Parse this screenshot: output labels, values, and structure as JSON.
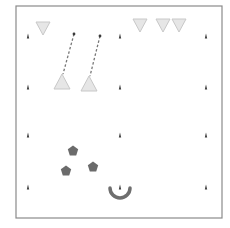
{
  "diagram": {
    "type": "drill-field",
    "colors": {
      "background": "#ffffff",
      "frame": "#8a8a8a",
      "marker": "#3a3a3a",
      "triangle_fill": "#e6e6e6",
      "triangle_stroke": "#c8c8c8",
      "path": "#777777",
      "pentagon": "#6b6b6b",
      "arc": "#6e6e6e"
    },
    "frame": {
      "x": 16,
      "y": 6,
      "w": 206,
      "h": 212
    },
    "markers": [
      {
        "x": 28,
        "y": 36
      },
      {
        "x": 120,
        "y": 36
      },
      {
        "x": 206,
        "y": 36
      },
      {
        "x": 28,
        "y": 87
      },
      {
        "x": 120,
        "y": 87
      },
      {
        "x": 206,
        "y": 87
      },
      {
        "x": 28,
        "y": 135
      },
      {
        "x": 120,
        "y": 135
      },
      {
        "x": 206,
        "y": 135
      },
      {
        "x": 28,
        "y": 187
      },
      {
        "x": 120,
        "y": 187
      },
      {
        "x": 206,
        "y": 187
      }
    ],
    "cones_down": [
      {
        "x": 43,
        "y": 28
      },
      {
        "x": 140,
        "y": 25
      },
      {
        "x": 163,
        "y": 25
      },
      {
        "x": 179,
        "y": 25
      }
    ],
    "cones_up": [
      {
        "x": 62,
        "y": 82
      },
      {
        "x": 89,
        "y": 84
      }
    ],
    "paths": [
      {
        "x1": 74,
        "y1": 34,
        "x2": 63,
        "y2": 74
      },
      {
        "x1": 100,
        "y1": 36,
        "x2": 90,
        "y2": 76
      }
    ],
    "players": [
      {
        "x": 73,
        "y": 151
      },
      {
        "x": 66,
        "y": 171
      },
      {
        "x": 93,
        "y": 167
      }
    ],
    "goal_arc": {
      "cx": 120,
      "cy": 188,
      "r": 10
    }
  }
}
